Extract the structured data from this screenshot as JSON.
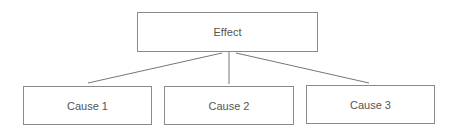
{
  "diagram": {
    "type": "cause-effect tree",
    "effect": {
      "label": "Effect"
    },
    "causes": [
      {
        "label": "Cause 1"
      },
      {
        "label": "Cause 2"
      },
      {
        "label": "Cause 3"
      }
    ],
    "colors": {
      "line": "#777777",
      "border": "#8a8a8a",
      "text": "#555555"
    }
  }
}
